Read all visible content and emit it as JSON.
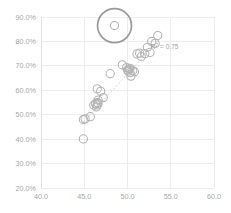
{
  "chart_data": {
    "type": "scatter",
    "title": "",
    "subtitle": "",
    "xlabel": "",
    "ylabel": "",
    "xlim": [
      40.0,
      60.0
    ],
    "ylim": [
      20.0,
      90.0
    ],
    "x_ticks": [
      40.0,
      45.0,
      50.0,
      55.0,
      60.0
    ],
    "x_tick_labels": [
      "40.0",
      "45.0",
      "50.0",
      "55.0",
      "60.0"
    ],
    "y_ticks": [
      20.0,
      30.0,
      40.0,
      50.0,
      60.0,
      70.0,
      80.0,
      90.0
    ],
    "y_tick_labels": [
      "20.0%",
      "30.0%",
      "40.0%",
      "50.0%",
      "60.0%",
      "70.0%",
      "80.0%",
      "90.0%"
    ],
    "grid": true,
    "grid_axis": "y",
    "legend": false,
    "legend_position": "none",
    "marker_style": "open-circle",
    "marker_color": "#b3b3b3",
    "annotations": [
      {
        "name": "r-squared-label",
        "text_prefix": "R",
        "text_superscript": "2",
        "text_suffix": " = 0.75",
        "text": "R² = 0.75",
        "x": 52.7,
        "y": 77.0
      }
    ],
    "highlight": {
      "name": "highlighted-outlier",
      "x": 48.5,
      "y": 86.5,
      "ring_radius_px": 17,
      "ring_color": "#9a9a9a",
      "label": ""
    },
    "trendline": {
      "type": "linear-fit",
      "style": "dashed",
      "color": "#cfcfcf",
      "r_squared": 0.75,
      "x_start": 44.9,
      "y_start": 47.0,
      "x_end": 53.6,
      "y_end": 80.5
    },
    "points": [
      {
        "x": 44.9,
        "y": 40.1
      },
      {
        "x": 44.9,
        "y": 48.0
      },
      {
        "x": 45.1,
        "y": 48.3
      },
      {
        "x": 45.7,
        "y": 49.2
      },
      {
        "x": 46.1,
        "y": 53.9
      },
      {
        "x": 46.3,
        "y": 54.5
      },
      {
        "x": 46.4,
        "y": 53.2
      },
      {
        "x": 46.5,
        "y": 55.0
      },
      {
        "x": 46.5,
        "y": 54.0
      },
      {
        "x": 46.6,
        "y": 56.0
      },
      {
        "x": 46.6,
        "y": 54.6
      },
      {
        "x": 46.5,
        "y": 60.6
      },
      {
        "x": 46.9,
        "y": 59.6
      },
      {
        "x": 47.2,
        "y": 57.0
      },
      {
        "x": 48.0,
        "y": 66.8
      },
      {
        "x": 48.5,
        "y": 86.5
      },
      {
        "x": 49.4,
        "y": 70.4
      },
      {
        "x": 49.9,
        "y": 69.3
      },
      {
        "x": 50.0,
        "y": 68.3
      },
      {
        "x": 50.1,
        "y": 67.8
      },
      {
        "x": 50.2,
        "y": 68.6
      },
      {
        "x": 50.3,
        "y": 67.2
      },
      {
        "x": 50.3,
        "y": 69.0
      },
      {
        "x": 50.4,
        "y": 65.8
      },
      {
        "x": 50.6,
        "y": 68.0
      },
      {
        "x": 50.8,
        "y": 67.6
      },
      {
        "x": 51.1,
        "y": 74.9
      },
      {
        "x": 51.4,
        "y": 75.2
      },
      {
        "x": 51.6,
        "y": 73.8
      },
      {
        "x": 52.0,
        "y": 75.0
      },
      {
        "x": 52.3,
        "y": 77.6
      },
      {
        "x": 52.6,
        "y": 75.5
      },
      {
        "x": 52.8,
        "y": 80.0
      },
      {
        "x": 53.2,
        "y": 79.2
      },
      {
        "x": 53.5,
        "y": 82.4
      }
    ]
  },
  "plot_geometry": {
    "left_px": 41,
    "right_px": 214,
    "top_px": 17,
    "bottom_px": 188,
    "marker_radius_px": 4.1
  }
}
